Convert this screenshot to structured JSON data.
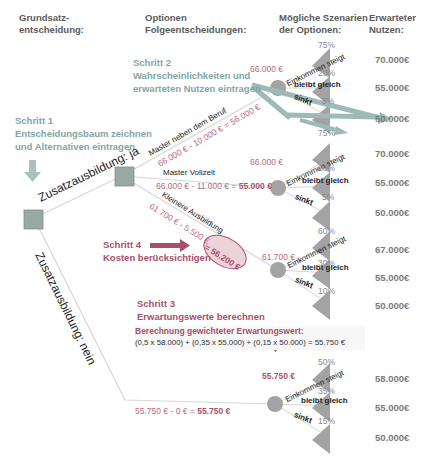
{
  "headers": {
    "col1": "Grundsatz-\nentscheidung:",
    "col1_line1": "Grundsatz-",
    "col1_line2": "entscheidung:",
    "col2_line1": "Optionen",
    "col2_line2": "Folgeentscheidungen:",
    "col3_line1": "Mögliche Szenarien",
    "col3_line2": "der Optionen:",
    "col4_line1": "Erwarteter",
    "col4_line2": "Nutzen:"
  },
  "steps": {
    "step1": {
      "title": "Schritt 1",
      "line1": "Entscheidungsbaum zeichnen",
      "line2": "und Alternativen eintragen"
    },
    "step2": {
      "title": "Schritt 2",
      "line1": "Wahrscheinlichkeiten und",
      "line2": "erwarteten Nutzen eintragen"
    },
    "step3": {
      "title": "Schritt 3",
      "line1": "Erwartungswerte berechnen"
    },
    "step4": {
      "title": "Schritt 4",
      "line1": "Kosten berücksichtigen"
    }
  },
  "root": {
    "branch_yes": "Zusatzausbildung: ja",
    "branch_no": "Zusatzausbildung: nein"
  },
  "options": [
    {
      "label": "Master neben dem Beruf",
      "calc": "66.000 € - 10.000 € = 56.000 €",
      "node_value": "66.000 €"
    },
    {
      "label": "Master Vollzeit",
      "calc_prefix": "66.000 € - 11.000 € = ",
      "calc_result": "55.000 €",
      "node_value": "66.000 €"
    },
    {
      "label": "Kleinere Ausbildung",
      "calc": "61.700 € - 5.500 €",
      "calc_result": "= 56.200 €",
      "node_value": "61.700 €"
    },
    {
      "label": "Zusatzausbildung: nein",
      "calc_prefix": "55.750 € - 0 € = ",
      "calc_result": "55.750 €",
      "node_value": "55.750 €"
    }
  ],
  "scenario_labels": {
    "up": "Einkommen steigt",
    "same": "bleibt gleich",
    "down": "sinkt"
  },
  "scenarios": [
    {
      "p": [
        "75%",
        "20%",
        "5%"
      ],
      "u": [
        "70.000€",
        "55.000€",
        "50.000€"
      ]
    },
    {
      "p": [
        "75%",
        "20%",
        "5%"
      ],
      "u": [
        "70.000€",
        "55.000€",
        "50.000€"
      ]
    },
    {
      "p": [
        "60%",
        "30%",
        "10%"
      ],
      "u": [
        "67.000€",
        "55.000€",
        "50.000€"
      ]
    },
    {
      "p": [
        "50%",
        "35%",
        "15%"
      ],
      "u": [
        "58.000€",
        "55.000€",
        "50.000€"
      ]
    }
  ],
  "formula": {
    "title": "Berechnung gewichteter Erwartungswert:",
    "expr": "(0,5 x 58.000) + (0,35 x 55.000) + (0,15 x 50.000) = 55.750 €"
  },
  "colors": {
    "teal": "#7fa6a3",
    "accent": "#a8506b",
    "node": "#9a9a9a",
    "line": "#d0d0d0"
  }
}
